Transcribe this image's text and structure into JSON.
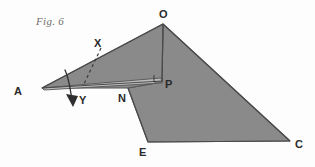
{
  "figure": {
    "caption": "Fig. 6",
    "caption_pos": {
      "x": 36,
      "y": 22
    },
    "background_color": "#fdfdfd",
    "fill_color": "#8a8a8a",
    "stroke_color": "#555555",
    "label_color": "#2a2a2a",
    "caption_color": "#6e6e6e"
  },
  "points": [
    {
      "id": "A",
      "label": "A",
      "x": 42,
      "y": 88,
      "label_x": 14,
      "label_y": 91
    },
    {
      "id": "O",
      "label": "O",
      "x": 163,
      "y": 24,
      "label_x": 160,
      "label_y": 15
    },
    {
      "id": "X",
      "label": "X",
      "x": 99,
      "y": 51,
      "label_x": 95,
      "label_y": 44
    },
    {
      "id": "Y",
      "label": "Y",
      "x": 74,
      "y": 102,
      "label_x": 79,
      "label_y": 101
    },
    {
      "id": "N",
      "label": "N",
      "x": 128,
      "y": 88,
      "label_x": 119,
      "label_y": 100
    },
    {
      "id": "P",
      "label": "P",
      "x": 162,
      "y": 82,
      "label_x": 166,
      "label_y": 85
    },
    {
      "id": "E",
      "label": "E",
      "x": 148,
      "y": 142,
      "label_x": 140,
      "label_y": 154
    },
    {
      "id": "C",
      "label": "C",
      "x": 290,
      "y": 141,
      "label_x": 296,
      "label_y": 146
    }
  ],
  "shapes": {
    "main_body": {
      "name": "main-gray-polygon",
      "points": "163,24 290,141 148,142 128,88 162,82"
    },
    "upper_left_triangle": {
      "name": "upper-left-triangle",
      "points": "42,88 163,24 162,82 128,88"
    },
    "flap_band": {
      "name": "flap-band-A-to-P",
      "points": "42,88 161,78 162,83 44,90"
    }
  },
  "lines": {
    "OP": {
      "name": "segment-O-P",
      "x1": 163,
      "y1": 24,
      "x2": 162,
      "y2": 82
    },
    "AP": {
      "name": "segment-A-P",
      "x1": 42,
      "y1": 88,
      "x2": 162,
      "y2": 81
    },
    "AO": {
      "name": "segment-A-O",
      "x1": 42,
      "y1": 88,
      "x2": 163,
      "y2": 24
    },
    "NE": {
      "name": "segment-N-E",
      "x1": 128,
      "y1": 88,
      "x2": 148,
      "y2": 142
    },
    "EC": {
      "name": "segment-E-C",
      "x1": 148,
      "y1": 142,
      "x2": 290,
      "y2": 141
    },
    "OC": {
      "name": "segment-O-C",
      "x1": 163,
      "y1": 24,
      "x2": 290,
      "y2": 141
    }
  },
  "fold_line": {
    "name": "dashed-fold-line-X",
    "x1": 101,
    "y1": 48,
    "x2": 84,
    "y2": 84,
    "dash": "3 3"
  },
  "right_angle_marker": {
    "name": "right-angle-at-P",
    "path": "M 154,75 L 154,82 L 161,82"
  },
  "motion_arrow": {
    "name": "rotation-arrow-Y",
    "path": "M 65,71 C 70,82 70,92 72,100",
    "head": "72,106 67,95 78,96"
  }
}
